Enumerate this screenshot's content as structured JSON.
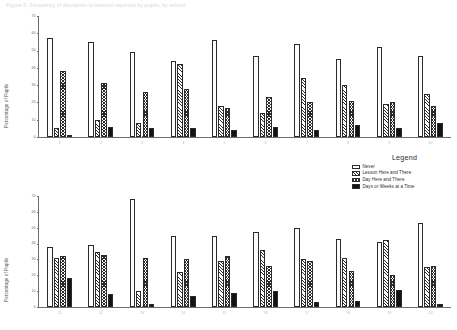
{
  "page": {
    "title": "Figure 5. Frequency of disruption to lessons reported by pupils, by school"
  },
  "legend": {
    "title": "Legend",
    "entries": [
      {
        "label": "Never",
        "pattern": "empty"
      },
      {
        "label": "Lesson Here and There",
        "pattern": "diagonal-hatch"
      },
      {
        "label": "Day Here and There",
        "pattern": "checkerboard"
      },
      {
        "label": "Days or Weeks at a Time",
        "pattern": "solid-black"
      }
    ]
  },
  "chart_data": [
    {
      "type": "bar",
      "title": "",
      "xlabel": "",
      "ylabel": "Percentage of Pupils",
      "ylim": [
        0,
        70
      ],
      "yticks": [
        70,
        60,
        50,
        40,
        30,
        20,
        10,
        0
      ],
      "grid": false,
      "legend_position": "right",
      "categories": [
        "1",
        "2",
        "3",
        "4",
        "5",
        "6",
        "7",
        "8",
        "9",
        "10"
      ],
      "series": [
        {
          "name": "Never",
          "values": [
            57,
            55,
            49,
            44,
            56,
            47,
            54,
            45,
            52,
            47
          ]
        },
        {
          "name": "Lesson Here and There",
          "values": [
            5,
            10,
            8,
            42,
            18,
            14,
            34,
            30,
            19,
            25
          ]
        },
        {
          "name": "Day Here and There",
          "values": [
            38,
            31,
            26,
            28,
            17,
            23,
            20,
            21,
            20,
            18
          ]
        },
        {
          "name": "Days or Weeks at a Time",
          "values": [
            1,
            6,
            5,
            5,
            4,
            6,
            4,
            7,
            5,
            8
          ]
        }
      ]
    },
    {
      "type": "bar",
      "title": "",
      "xlabel": "",
      "ylabel": "Percentage of Pupils",
      "ylim": [
        0,
        70
      ],
      "yticks": [
        70,
        60,
        50,
        40,
        30,
        20,
        10,
        0
      ],
      "grid": false,
      "legend_position": "right",
      "categories": [
        "11",
        "12",
        "13",
        "14",
        "15",
        "16",
        "17",
        "18",
        "19",
        "20"
      ],
      "series": [
        {
          "name": "Never",
          "values": [
            38,
            39,
            68,
            45,
            45,
            47,
            50,
            43,
            41,
            53
          ]
        },
        {
          "name": "Lesson Here and There",
          "values": [
            31,
            35,
            10,
            22,
            29,
            36,
            30,
            31,
            42,
            25
          ]
        },
        {
          "name": "Day Here and There",
          "values": [
            32,
            33,
            31,
            30,
            32,
            26,
            29,
            23,
            20,
            26
          ]
        },
        {
          "name": "Days or Weeks at a Time",
          "values": [
            18,
            8,
            2,
            7,
            9,
            10,
            3,
            4,
            11,
            2
          ]
        }
      ]
    }
  ]
}
